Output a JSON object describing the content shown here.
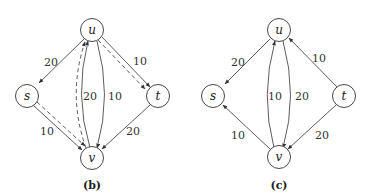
{
  "figures": [
    {
      "id": "b",
      "caption": "(b)",
      "nodes": [
        {
          "id": "u",
          "label": "u"
        },
        {
          "id": "s",
          "label": "s"
        },
        {
          "id": "t",
          "label": "t"
        },
        {
          "id": "v",
          "label": "v"
        }
      ],
      "edges": [
        {
          "from": "u",
          "to": "s",
          "weight": "20",
          "style": "solid"
        },
        {
          "from": "u",
          "to": "t",
          "weight": "10",
          "style": "solid"
        },
        {
          "from": "u",
          "to": "t",
          "weight": "",
          "style": "dashed"
        },
        {
          "from": "s",
          "to": "v",
          "weight": "10",
          "style": "solid"
        },
        {
          "from": "s",
          "to": "v",
          "weight": "",
          "style": "dashed"
        },
        {
          "from": "t",
          "to": "v",
          "weight": "20",
          "style": "solid"
        },
        {
          "from": "v",
          "to": "u",
          "weight": "20",
          "style": "solid"
        },
        {
          "from": "u",
          "to": "v",
          "weight": "10",
          "style": "solid"
        },
        {
          "from": "v",
          "to": "u",
          "weight": "",
          "style": "dashed"
        }
      ],
      "labels": {
        "us": "20",
        "ut": "10",
        "sv": "10",
        "tv": "20",
        "vu": "20",
        "uv": "10"
      }
    },
    {
      "id": "c",
      "caption": "(c)",
      "nodes": [
        {
          "id": "u",
          "label": "u"
        },
        {
          "id": "s",
          "label": "s"
        },
        {
          "id": "t",
          "label": "t"
        },
        {
          "id": "v",
          "label": "v"
        }
      ],
      "edges": [
        {
          "from": "u",
          "to": "s",
          "weight": "20",
          "style": "solid"
        },
        {
          "from": "t",
          "to": "u",
          "weight": "10",
          "style": "solid"
        },
        {
          "from": "v",
          "to": "s",
          "weight": "10",
          "style": "solid"
        },
        {
          "from": "t",
          "to": "v",
          "weight": "20",
          "style": "solid"
        },
        {
          "from": "v",
          "to": "u",
          "weight": "10",
          "style": "solid"
        },
        {
          "from": "u",
          "to": "v",
          "weight": "20",
          "style": "solid"
        }
      ],
      "labels": {
        "us": "20",
        "tu": "10",
        "vs": "10",
        "tv": "20",
        "vu": "10",
        "uv": "20"
      }
    }
  ]
}
